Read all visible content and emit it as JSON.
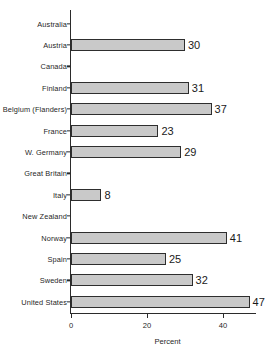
{
  "chart_data": {
    "type": "bar",
    "orientation": "horizontal",
    "title": "",
    "subtitle": "",
    "xlabel": "Percent",
    "ylabel": "",
    "xlim": [
      0,
      49
    ],
    "xticks": [
      0,
      20,
      40
    ],
    "xtick_labels": [
      "0",
      "20",
      "40"
    ],
    "grid": false,
    "legend": false,
    "legend_position": "none",
    "bar_fill_color": "#c9c9c9",
    "bar_edge_color": "#2e2e2e",
    "axis_color": "#2b2b2b",
    "background_color": "#ffffff",
    "categories": [
      "Australia",
      "Austria",
      "Canada",
      "Finland",
      "Belgium (Flanders)",
      "France",
      "W. Germany",
      "Great Britain",
      "Italy",
      "New Zealand",
      "Norway",
      "Spain",
      "Sweden",
      "United States"
    ],
    "values": [
      null,
      30,
      null,
      31,
      37,
      23,
      29,
      null,
      8,
      null,
      41,
      25,
      32,
      47
    ],
    "value_labels": [
      "",
      "30",
      "",
      "31",
      "37",
      "23",
      "29",
      "",
      "8",
      "",
      "41",
      "25",
      "32",
      "47"
    ],
    "rows": [
      {
        "label": "Australia",
        "value": null,
        "value_label": ""
      },
      {
        "label": "Austria",
        "value": 30,
        "value_label": "30"
      },
      {
        "label": "Canada",
        "value": null,
        "value_label": ""
      },
      {
        "label": "Finland",
        "value": 31,
        "value_label": "31"
      },
      {
        "label": "Belgium (Flanders)",
        "value": 37,
        "value_label": "37"
      },
      {
        "label": "France",
        "value": 23,
        "value_label": "23"
      },
      {
        "label": "W. Germany",
        "value": 29,
        "value_label": "29"
      },
      {
        "label": "Great Britain",
        "value": null,
        "value_label": ""
      },
      {
        "label": "Italy",
        "value": 8,
        "value_label": "8"
      },
      {
        "label": "New Zealand",
        "value": null,
        "value_label": ""
      },
      {
        "label": "Norway",
        "value": 41,
        "value_label": "41"
      },
      {
        "label": "Spain",
        "value": 25,
        "value_label": "25"
      },
      {
        "label": "Sweden",
        "value": 32,
        "value_label": "32"
      },
      {
        "label": "United States",
        "value": 47,
        "value_label": "47"
      }
    ]
  }
}
